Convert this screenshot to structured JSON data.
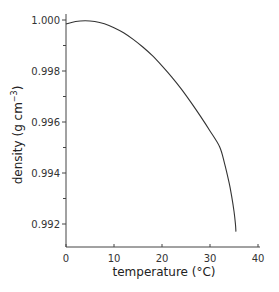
{
  "chart_data": {
    "type": "line",
    "title": "",
    "xlabel": "temperature (°C)",
    "ylabel_main": "density (g cm",
    "ylabel_sup": "−3",
    "ylabel_close": ")",
    "xlim": [
      0,
      40
    ],
    "ylim": [
      0.99106,
      1.0
    ],
    "xticks": [
      0,
      10,
      20,
      30,
      40
    ],
    "xtick_labels": [
      "0",
      "10",
      "20",
      "30",
      "40"
    ],
    "yticks": [
      0.992,
      0.993,
      0.994,
      0.995,
      0.996,
      0.997,
      0.998,
      0.999,
      1.0
    ],
    "ytick_labels": [
      "0.992",
      "",
      "0.994",
      "",
      "0.996",
      "",
      "0.998",
      "",
      "1.000"
    ],
    "grid": false,
    "legend": "none",
    "series": [
      {
        "name": "water density",
        "x": [
          0,
          2,
          4,
          6,
          8,
          10,
          12,
          14,
          16,
          18,
          20,
          22,
          24,
          26,
          28,
          30,
          32,
          33,
          34,
          34.5,
          35,
          35.3,
          35.4
        ],
        "y": [
          0.99984,
          0.99994,
          0.99997,
          0.99994,
          0.99985,
          0.9997,
          0.9995,
          0.99924,
          0.99894,
          0.9986,
          0.9982,
          0.99777,
          0.9973,
          0.99678,
          0.99623,
          0.99565,
          0.99503,
          0.9944,
          0.9936,
          0.9931,
          0.9925,
          0.992,
          0.9917
        ]
      }
    ]
  }
}
